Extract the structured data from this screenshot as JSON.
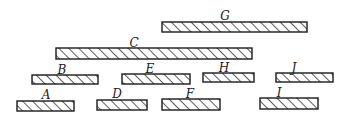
{
  "diagram": {
    "colors": {
      "stroke": "#1a1a1a",
      "fill": "#ffffff",
      "hatch": "#1a1a1a"
    },
    "bars": [
      {
        "label": "G",
        "x": 162,
        "y": 22,
        "w": 145,
        "h": 10,
        "lx": 225,
        "ly": 20
      },
      {
        "label": "C",
        "x": 56,
        "y": 48,
        "w": 196,
        "h": 11,
        "lx": 134,
        "ly": 47
      },
      {
        "label": "B",
        "x": 32,
        "y": 75,
        "w": 66,
        "h": 9,
        "lx": 62,
        "ly": 74
      },
      {
        "label": "E",
        "x": 122,
        "y": 74,
        "w": 68,
        "h": 10,
        "lx": 150,
        "ly": 73
      },
      {
        "label": "H",
        "x": 203,
        "y": 73,
        "w": 51,
        "h": 9,
        "lx": 224,
        "ly": 72
      },
      {
        "label": "J",
        "x": 276,
        "y": 73,
        "w": 57,
        "h": 9,
        "lx": 294,
        "ly": 72
      },
      {
        "label": "A",
        "x": 17,
        "y": 101,
        "w": 57,
        "h": 10,
        "lx": 46,
        "ly": 99
      },
      {
        "label": "D",
        "x": 97,
        "y": 100,
        "w": 50,
        "h": 10,
        "lx": 117,
        "ly": 98
      },
      {
        "label": "F",
        "x": 162,
        "y": 99,
        "w": 58,
        "h": 11,
        "lx": 190,
        "ly": 98
      },
      {
        "label": "I",
        "x": 260,
        "y": 98,
        "w": 58,
        "h": 11,
        "lx": 279,
        "ly": 97
      }
    ]
  }
}
